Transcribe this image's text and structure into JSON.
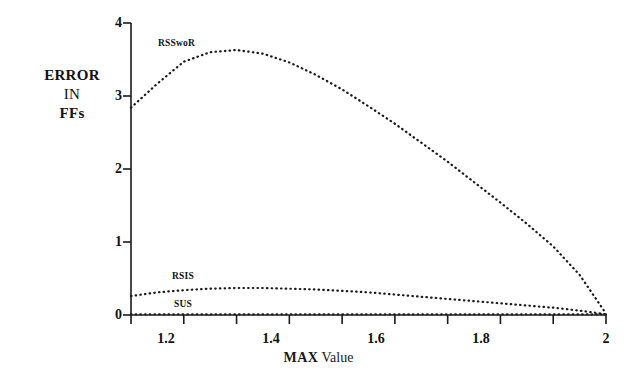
{
  "chart_data": {
    "type": "line",
    "title": "",
    "subtitle": "",
    "xlabel_bold": "MAX",
    "xlabel_normal": " Value",
    "xlabel": "MAX Value",
    "ylabel_lines": [
      "ERROR",
      "IN",
      "FFs"
    ],
    "ylabel": "ERROR IN FFs",
    "xlim": [
      1.1,
      2.0
    ],
    "ylim": [
      0,
      4
    ],
    "grid": false,
    "legend_position": "inline-annotations",
    "xticks": [
      1.2,
      1.4,
      1.6,
      1.8,
      2
    ],
    "xtick_labels": [
      "1.2",
      "1.4",
      "1.6",
      "1.8",
      "2"
    ],
    "xminor_ticks": [
      1.1,
      1.3,
      1.5,
      1.7,
      1.9
    ],
    "yticks": [
      0,
      1,
      2,
      3,
      4
    ],
    "ytick_labels": [
      "0",
      "1",
      "2",
      "3",
      "4"
    ],
    "line_style": "dotted",
    "series": [
      {
        "name": "RSSwoR",
        "x": [
          1.1,
          1.15,
          1.2,
          1.25,
          1.3,
          1.35,
          1.4,
          1.45,
          1.5,
          1.55,
          1.6,
          1.65,
          1.7,
          1.75,
          1.8,
          1.85,
          1.9,
          1.95,
          2.0
        ],
        "values": [
          2.84,
          3.17,
          3.47,
          3.6,
          3.63,
          3.58,
          3.46,
          3.29,
          3.09,
          2.86,
          2.62,
          2.36,
          2.1,
          1.82,
          1.54,
          1.25,
          0.94,
          0.55,
          0.02
        ]
      },
      {
        "name": "RSIS",
        "x": [
          1.1,
          1.15,
          1.2,
          1.25,
          1.3,
          1.35,
          1.4,
          1.45,
          1.5,
          1.55,
          1.6,
          1.65,
          1.7,
          1.75,
          1.8,
          1.85,
          1.9,
          1.95,
          2.0
        ],
        "values": [
          0.26,
          0.31,
          0.34,
          0.36,
          0.37,
          0.37,
          0.36,
          0.35,
          0.33,
          0.31,
          0.28,
          0.25,
          0.22,
          0.19,
          0.16,
          0.13,
          0.1,
          0.06,
          0.01
        ]
      },
      {
        "name": "SUS",
        "x": [
          1.1,
          1.2,
          1.3,
          1.4,
          1.5,
          1.6,
          1.7,
          1.8,
          1.9,
          2.0
        ],
        "values": [
          0.01,
          0.01,
          0.01,
          0.01,
          0.01,
          0.01,
          0.01,
          0.01,
          0.01,
          0.01
        ]
      }
    ],
    "annotations": [
      {
        "text": "RSSwoR",
        "x": 1.19,
        "y": 3.84
      },
      {
        "text": "RSIS",
        "x": 1.21,
        "y": 0.62
      },
      {
        "text": "SUS",
        "x": 1.21,
        "y": 0.16
      }
    ],
    "colors": {
      "axis": "#1a1a1a",
      "curve": "#1a1a1a",
      "background": "#ffffff",
      "text": "#111111"
    }
  }
}
